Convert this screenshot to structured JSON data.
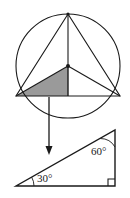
{
  "figure": {
    "background_color": "#ffffff",
    "stroke_color": "#1a1a1a",
    "shade_color": "#9a9a9a",
    "upper_diagram": {
      "name": "circle-with-inscribed-triangle",
      "circle": {
        "center_x": 68,
        "center_y": 66,
        "radius": 52
      },
      "inscribed_triangle": {
        "apex_x": 68,
        "apex_y": 14,
        "left_x": 16,
        "left_y": 96,
        "right_x": 120,
        "right_y": 96
      },
      "center_point": {
        "x": 68,
        "y": 66,
        "dot_radius": 2
      },
      "radii_to_vertices": true,
      "altitude_to_base": true,
      "shaded_region": {
        "label": "shaded-half-triangle",
        "vertex_a_x": 16,
        "vertex_a_y": 96,
        "vertex_b_x": 68,
        "vertex_b_y": 66,
        "vertex_c_x": 68,
        "vertex_c_y": 96,
        "fill": "#9a9a9a"
      }
    },
    "arrow": {
      "name": "downward-arrow",
      "start_x": 49,
      "start_y": 97,
      "end_x": 49,
      "end_y": 155
    },
    "lower_diagram": {
      "name": "right-triangle-30-60-90",
      "left_vertex_x": 16,
      "left_vertex_y": 186,
      "right_vertex_x": 115,
      "right_vertex_y": 186,
      "apex_x": 115,
      "apex_y": 130,
      "right_angle_mark_size": 7,
      "angles": [
        {
          "name": "angle-30",
          "value": "30°",
          "label_x": 37,
          "label_y": 182,
          "arc_center_x": 16,
          "arc_center_y": 186
        },
        {
          "name": "angle-60",
          "value": "60°",
          "label_x": 91,
          "label_y": 155,
          "arc_center_x": 115,
          "arc_center_y": 130
        }
      ]
    }
  }
}
